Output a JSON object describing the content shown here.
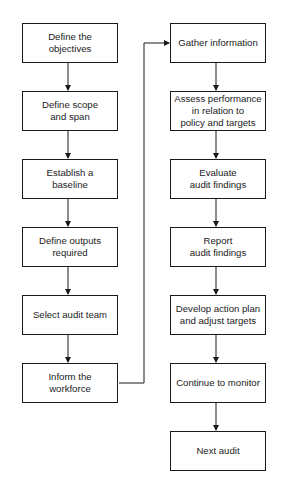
{
  "diagram": {
    "type": "flowchart",
    "colors": {
      "line": "#1a1a1a",
      "text": "#222222",
      "background": "#ffffff"
    },
    "left_column": [
      {
        "id": "L1",
        "label": "Define the\nobjectives"
      },
      {
        "id": "L2",
        "label": "Define scope\nand span"
      },
      {
        "id": "L3",
        "label": "Establish a\nbaseline"
      },
      {
        "id": "L4",
        "label": "Define outputs\nrequired"
      },
      {
        "id": "L5",
        "label": "Select audit team"
      },
      {
        "id": "L6",
        "label": "Inform the\nworkforce"
      }
    ],
    "right_column": [
      {
        "id": "R1",
        "label": "Gather information"
      },
      {
        "id": "R2",
        "label": "Assess performance\nin relation to\npolicy and targets"
      },
      {
        "id": "R3",
        "label": "Evaluate\naudit findings"
      },
      {
        "id": "R4",
        "label": "Report\naudit findings"
      },
      {
        "id": "R5",
        "label": "Develop action plan\nand adjust targets"
      },
      {
        "id": "R6",
        "label": "Continue to monitor"
      },
      {
        "id": "R7",
        "label": "Next audit"
      }
    ],
    "edges": [
      [
        "L1",
        "L2"
      ],
      [
        "L2",
        "L3"
      ],
      [
        "L3",
        "L4"
      ],
      [
        "L4",
        "L5"
      ],
      [
        "L5",
        "L6"
      ],
      [
        "L6",
        "R1"
      ],
      [
        "R1",
        "R2"
      ],
      [
        "R2",
        "R3"
      ],
      [
        "R3",
        "R4"
      ],
      [
        "R4",
        "R5"
      ],
      [
        "R5",
        "R6"
      ],
      [
        "R6",
        "R7"
      ]
    ]
  }
}
